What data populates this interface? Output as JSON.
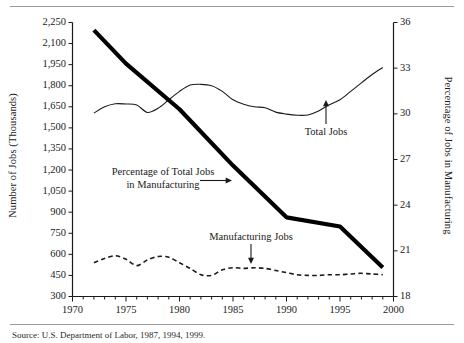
{
  "figure": {
    "rule_top": "",
    "rule_bottom": "",
    "source_note": "Source: U.S. Department of Labor, 1987, 1994, 1999."
  },
  "chart_data": {
    "type": "line",
    "title": "",
    "xlabel": "",
    "ylabel": "Number of Jobs (Thousands)",
    "y2label": "Percentage of Jobs in Manufacturing",
    "grid": false,
    "legend": "none",
    "xlim": [
      1970,
      2000
    ],
    "ylim": [
      300,
      2250
    ],
    "y2lim": [
      18,
      36
    ],
    "xticks": [
      1970,
      1975,
      1980,
      1985,
      1990,
      1995,
      2000
    ],
    "xtick_labels": [
      "1970",
      "1975",
      "1980",
      "1985",
      "1990",
      "1995",
      "2000"
    ],
    "xminor_step": 1,
    "yticks": [
      300,
      450,
      600,
      750,
      900,
      1050,
      1200,
      1350,
      1500,
      1650,
      1800,
      1950,
      2100,
      2250
    ],
    "ytick_labels": [
      "300",
      "450",
      "600",
      "750",
      "900",
      "1,050",
      "1,200",
      "1,350",
      "1,500",
      "1,650",
      "1,800",
      "1,950",
      "2,100",
      "2,250"
    ],
    "y2ticks": [
      18,
      21,
      24,
      27,
      30,
      33,
      36
    ],
    "y2tick_labels": [
      "18",
      "21",
      "24",
      "27",
      "30",
      "33",
      "36"
    ],
    "series": [
      {
        "name": "Total Jobs",
        "axis": "left",
        "style": "thin-solid",
        "color": "#1a1a1a",
        "x": [
          1972,
          1973,
          1974,
          1975,
          1976,
          1977,
          1978,
          1979,
          1980,
          1981,
          1982,
          1983,
          1984,
          1985,
          1986,
          1987,
          1988,
          1989,
          1990,
          1991,
          1992,
          1993,
          1994,
          1995,
          1996,
          1997,
          1998,
          1999
        ],
        "values": [
          1605,
          1650,
          1672,
          1670,
          1663,
          1610,
          1640,
          1700,
          1760,
          1805,
          1810,
          1800,
          1760,
          1700,
          1668,
          1650,
          1643,
          1612,
          1598,
          1590,
          1592,
          1620,
          1665,
          1700,
          1760,
          1820,
          1880,
          1930
        ]
      },
      {
        "name": "Manufacturing Jobs",
        "axis": "left",
        "style": "dashed",
        "color": "#1a1a1a",
        "x": [
          1972,
          1973,
          1974,
          1975,
          1976,
          1977,
          1978,
          1979,
          1980,
          1981,
          1982,
          1983,
          1984,
          1985,
          1986,
          1987,
          1988,
          1989,
          1990,
          1991,
          1992,
          1993,
          1994,
          1995,
          1996,
          1997,
          1998,
          1999
        ],
        "values": [
          540,
          570,
          590,
          565,
          520,
          560,
          585,
          580,
          540,
          500,
          455,
          450,
          490,
          505,
          500,
          505,
          500,
          485,
          470,
          455,
          450,
          450,
          455,
          455,
          460,
          465,
          460,
          455
        ]
      },
      {
        "name": "Percentage of Total Jobs in Manufacturing",
        "axis": "right",
        "style": "thick-solid",
        "color": "#000000",
        "x": [
          1972,
          1975,
          1980,
          1985,
          1990,
          1995,
          1999
        ],
        "values": [
          35.5,
          33.3,
          30.3,
          26.6,
          23.2,
          22.6,
          19.9
        ]
      }
    ],
    "annotations": [
      {
        "name": "percentage-label",
        "text_line1": "Percentage of Total Jobs",
        "text_line2": "in Manufacturing",
        "arrow": "right"
      },
      {
        "name": "total-jobs-label",
        "text_line1": "Total Jobs",
        "arrow": "up"
      },
      {
        "name": "manufacturing-jobs-label",
        "text_line1": "Manufacturing Jobs",
        "arrow": "down"
      }
    ]
  }
}
